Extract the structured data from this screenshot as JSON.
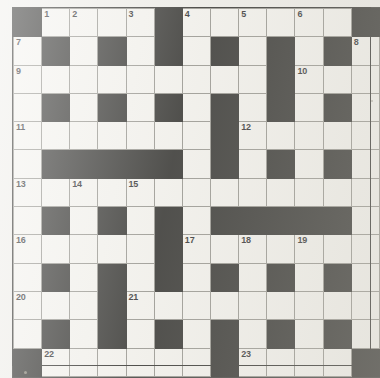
{
  "puzzle": {
    "kind": "crossword-grid",
    "rows": 13,
    "cols": 13,
    "colors": {
      "paper": "#efeeea",
      "white_cell": "#f4f3ef",
      "black_cell": "#1d1d1b",
      "grid_line": "#8d8c86",
      "frame": "#1d1d1b",
      "number_text": "#17171a"
    },
    "cells": [
      [
        1,
        0,
        0,
        0,
        0,
        1,
        0,
        0,
        0,
        0,
        0,
        0,
        1
      ],
      [
        0,
        1,
        0,
        1,
        0,
        1,
        0,
        1,
        0,
        1,
        0,
        1,
        0
      ],
      [
        0,
        0,
        0,
        0,
        0,
        0,
        0,
        0,
        0,
        1,
        0,
        0,
        0
      ],
      [
        0,
        1,
        0,
        1,
        0,
        1,
        0,
        1,
        0,
        1,
        0,
        1,
        0
      ],
      [
        0,
        0,
        0,
        0,
        0,
        0,
        0,
        1,
        0,
        0,
        0,
        0,
        0
      ],
      [
        0,
        1,
        1,
        1,
        1,
        1,
        0,
        1,
        0,
        1,
        0,
        1,
        0
      ],
      [
        0,
        0,
        0,
        0,
        0,
        0,
        0,
        0,
        0,
        0,
        0,
        0,
        0
      ],
      [
        0,
        1,
        0,
        1,
        0,
        1,
        0,
        1,
        1,
        1,
        1,
        1,
        0
      ],
      [
        0,
        0,
        0,
        0,
        0,
        1,
        0,
        0,
        0,
        0,
        0,
        0,
        0
      ],
      [
        0,
        1,
        0,
        1,
        0,
        1,
        0,
        1,
        0,
        1,
        0,
        1,
        0
      ],
      [
        0,
        0,
        0,
        1,
        0,
        0,
        0,
        0,
        0,
        0,
        0,
        0,
        0
      ],
      [
        0,
        1,
        0,
        1,
        0,
        1,
        0,
        1,
        0,
        1,
        0,
        1,
        0
      ],
      [
        1,
        0,
        0,
        0,
        0,
        0,
        0,
        1,
        0,
        0,
        0,
        0,
        1
      ]
    ],
    "numbers": [
      {
        "row": 0,
        "col": 1,
        "label": "1"
      },
      {
        "row": 0,
        "col": 2,
        "label": "2"
      },
      {
        "row": 0,
        "col": 4,
        "label": "3"
      },
      {
        "row": 0,
        "col": 6,
        "label": "4"
      },
      {
        "row": 0,
        "col": 8,
        "label": "5"
      },
      {
        "row": 0,
        "col": 10,
        "label": "6"
      },
      {
        "row": 1,
        "col": 0,
        "label": "7"
      },
      {
        "row": 1,
        "col": 12,
        "label": "8"
      },
      {
        "row": 2,
        "col": 0,
        "label": "9"
      },
      {
        "row": 2,
        "col": 10,
        "label": "10"
      },
      {
        "row": 4,
        "col": 0,
        "label": "11"
      },
      {
        "row": 4,
        "col": 8,
        "label": "12"
      },
      {
        "row": 6,
        "col": 0,
        "label": "13"
      },
      {
        "row": 6,
        "col": 2,
        "label": "14"
      },
      {
        "row": 6,
        "col": 4,
        "label": "15"
      },
      {
        "row": 8,
        "col": 0,
        "label": "16"
      },
      {
        "row": 8,
        "col": 6,
        "label": "17"
      },
      {
        "row": 8,
        "col": 8,
        "label": "18"
      },
      {
        "row": 8,
        "col": 10,
        "label": "19"
      },
      {
        "row": 10,
        "col": 0,
        "label": "20"
      },
      {
        "row": 10,
        "col": 4,
        "label": "21"
      },
      {
        "row": 12,
        "col": 1,
        "label": "22"
      },
      {
        "row": 12,
        "col": 8,
        "label": "23"
      }
    ]
  }
}
